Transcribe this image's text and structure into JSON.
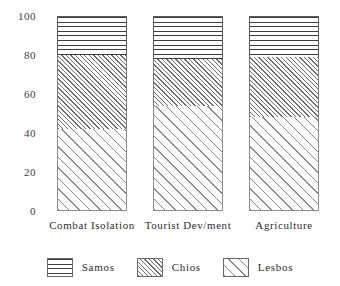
{
  "chart_data": {
    "type": "bar",
    "subtype": "stacked-100-percent",
    "title": "",
    "xlabel": "",
    "ylabel": "",
    "ylim": [
      0,
      100
    ],
    "yticks": [
      0,
      20,
      40,
      60,
      80,
      100
    ],
    "ytick_labels": [
      "0",
      "20",
      "40",
      "60",
      "80",
      "100"
    ],
    "grid": false,
    "legend_position": "bottom",
    "categories": [
      "Combat Isolation",
      "Tourist Dev/ment",
      "Agriculture"
    ],
    "series": [
      {
        "name": "Samos",
        "pattern": "horizontal-lines",
        "values": [
          20,
          22,
          21
        ]
      },
      {
        "name": "Chios",
        "pattern": "dense-diagonal-hatch",
        "values": [
          38,
          24,
          31
        ]
      },
      {
        "name": "Lesbos",
        "pattern": "sparse-diagonal-lines",
        "values": [
          42,
          54,
          48
        ]
      }
    ],
    "stack_order_top_to_bottom": [
      "Samos",
      "Chios",
      "Lesbos"
    ]
  },
  "axis": {
    "y_ticks": [
      {
        "label": "100",
        "value": 100
      },
      {
        "label": "80",
        "value": 80
      },
      {
        "label": "60",
        "value": 60
      },
      {
        "label": "40",
        "value": 40
      },
      {
        "label": "20",
        "value": 20
      },
      {
        "label": "0",
        "value": 0
      }
    ]
  },
  "legend": {
    "items": [
      {
        "label": "Samos",
        "pattern": "horizontal-lines"
      },
      {
        "label": "Chios",
        "pattern": "dense-diagonal-hatch"
      },
      {
        "label": "Lesbos",
        "pattern": "sparse-diagonal-lines"
      }
    ]
  },
  "colors": {
    "background": "#ffffff",
    "ink": "#2b2b2b",
    "pattern_samos": "#3c3c3c",
    "pattern_chios": "#6e6e6e",
    "pattern_lesbos": "#8a8a8a"
  }
}
